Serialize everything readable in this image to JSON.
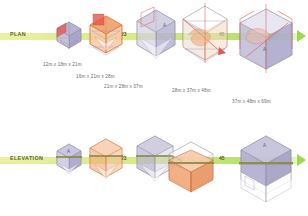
{
  "diagram": {
    "rows": [
      {
        "id": "plan",
        "label": "PLAN",
        "label_x": 10,
        "label_y": 31,
        "axis_y": 33,
        "markers": [
          {
            "text": "1",
            "x": 78,
            "y": 31
          },
          {
            "text": "23",
            "x": 121,
            "y": 31
          },
          {
            "text": "45",
            "x": 219,
            "y": 31
          }
        ]
      },
      {
        "id": "elevation",
        "label": "ELEVATION",
        "label_x": 10,
        "label_y": 155,
        "axis_y": 157,
        "markers": [
          {
            "text": "1",
            "x": 78,
            "y": 155
          },
          {
            "text": "23",
            "x": 121,
            "y": 155
          },
          {
            "text": "45",
            "x": 219,
            "y": 155
          }
        ]
      }
    ],
    "dimension_notes": [
      {
        "text": "12m x 18m x 21m",
        "x": 43,
        "y": 62
      },
      {
        "text": "16m x 21m x 28m",
        "x": 76,
        "y": 74
      },
      {
        "text": "21m x 28m x 37m",
        "x": 104,
        "y": 84
      },
      {
        "text": "28m x 37m x 48m",
        "x": 172,
        "y": 88
      },
      {
        "text": "37m x 48m x 69m",
        "x": 232,
        "y": 99
      }
    ],
    "vertex_labels": [
      {
        "text": "A",
        "x": 188,
        "y": 22
      },
      {
        "text": "A",
        "x": 263,
        "y": 48
      },
      {
        "text": "A",
        "x": 183,
        "y": 134
      },
      {
        "text": "A",
        "x": 262,
        "y": 144
      }
    ],
    "colors": {
      "axis_light": "#e8ef9e",
      "axis_bright": "#a8dc55",
      "axis_arrow": "#9ed94b",
      "label_text": "#5e6b20",
      "marker_text": "#4d5a17",
      "note_text": "#6a6a6a",
      "mass_lavender": "#b7b3d2",
      "mass_lavender_dark": "#9c98bd",
      "mass_lavender_light": "#c9c6de",
      "mass_orange": "#f0a878",
      "mass_orange_light": "#f7c9a7",
      "mass_orange_line": "#e06a2c",
      "wire_gray": "#8a8a9a",
      "wire_red": "#e0584a",
      "band_olive": "#8a8640"
    },
    "figures": [
      {
        "id": "plan-1",
        "row": "plan",
        "x": 53,
        "y": 19,
        "w": 30,
        "h": 30,
        "scale": 0.52,
        "style": "lavender-small",
        "accent": "red"
      },
      {
        "id": "plan-2",
        "row": "plan",
        "x": 84,
        "y": 12,
        "w": 42,
        "h": 44,
        "scale": 0.72,
        "style": "orange-open",
        "accent": "red"
      },
      {
        "id": "plan-3",
        "row": "plan",
        "x": 128,
        "y": 6,
        "w": 52,
        "h": 56,
        "scale": 0.9,
        "style": "lavender-wire",
        "accent": "red"
      },
      {
        "id": "plan-4",
        "row": "plan",
        "x": 173,
        "y": 2,
        "w": 62,
        "h": 66,
        "scale": 1.08,
        "style": "orange-spiral",
        "accent": "red"
      },
      {
        "id": "plan-5",
        "row": "plan",
        "x": 227,
        "y": 2,
        "w": 76,
        "h": 76,
        "scale": 1.3,
        "style": "lavender-large",
        "accent": "red"
      },
      {
        "id": "elev-1",
        "row": "elevation",
        "x": 53,
        "y": 140,
        "w": 30,
        "h": 32,
        "scale": 0.52,
        "style": "lavender-small",
        "accent": "none"
      },
      {
        "id": "elev-2",
        "row": "elevation",
        "x": 84,
        "y": 134,
        "w": 42,
        "h": 44,
        "scale": 0.72,
        "style": "orange-open",
        "accent": "none"
      },
      {
        "id": "elev-3",
        "row": "elevation",
        "x": 128,
        "y": 130,
        "w": 52,
        "h": 54,
        "scale": 0.9,
        "style": "lavender-wire",
        "accent": "none"
      },
      {
        "id": "elev-4",
        "row": "elevation",
        "x": 160,
        "y": 136,
        "w": 60,
        "h": 56,
        "scale": 1.08,
        "style": "orange-block",
        "accent": "none"
      },
      {
        "id": "elev-5",
        "row": "elevation",
        "x": 228,
        "y": 128,
        "w": 72,
        "h": 76,
        "scale": 1.3,
        "style": "lavender-large",
        "accent": "none"
      }
    ]
  }
}
